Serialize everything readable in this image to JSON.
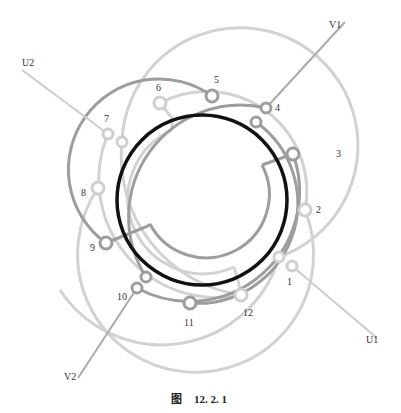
{
  "caption": {
    "prefix": "图",
    "number": "12. 2. 1"
  },
  "colors": {
    "rotor": "#111111",
    "dark_coil": "#9a9a9a",
    "light_coil": "#cfcfcf",
    "lead": "#b5b5b5",
    "text": "#333333"
  },
  "rotor": {
    "cx": 202,
    "cy": 200,
    "r": 85
  },
  "terminal_labels": [
    {
      "id": "1",
      "x": 287,
      "y": 285
    },
    {
      "id": "2",
      "x": 316,
      "y": 213
    },
    {
      "id": "3",
      "x": 336,
      "y": 157
    },
    {
      "id": "4",
      "x": 275,
      "y": 111
    },
    {
      "id": "5",
      "x": 214,
      "y": 83
    },
    {
      "id": "6",
      "x": 156,
      "y": 91
    },
    {
      "id": "7",
      "x": 104,
      "y": 122
    },
    {
      "id": "8",
      "x": 81,
      "y": 196
    },
    {
      "id": "9",
      "x": 90,
      "y": 251
    },
    {
      "id": "10",
      "x": 117,
      "y": 300
    },
    {
      "id": "11",
      "x": 184,
      "y": 326
    },
    {
      "id": "12",
      "x": 243,
      "y": 316
    }
  ],
  "lead_labels": [
    {
      "id": "V1",
      "x": 329,
      "y": 28
    },
    {
      "id": "U2",
      "x": 22,
      "y": 66
    },
    {
      "id": "V2",
      "x": 64,
      "y": 380
    },
    {
      "id": "U1",
      "x": 366,
      "y": 343
    }
  ]
}
